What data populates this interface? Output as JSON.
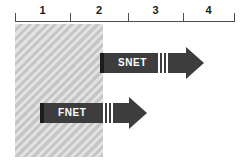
{
  "figure": {
    "background_color": "#ffffff",
    "width": 248,
    "height": 167
  },
  "axis": {
    "name": "phase-timeline",
    "line_color": "#4d4d4d",
    "tick_positions": [
      15,
      70,
      128,
      183,
      234
    ],
    "labels": [
      {
        "text": "1",
        "left": 15,
        "width": 55
      },
      {
        "text": "2",
        "left": 70,
        "width": 58
      },
      {
        "text": "3",
        "left": 128,
        "width": 55
      },
      {
        "text": "4",
        "left": 183,
        "width": 51
      }
    ]
  },
  "region": {
    "name": "hatched-phase-region",
    "fill_color": "#c6c6c6",
    "hatch_color": "#e2e2e2",
    "left": 15,
    "top": 24,
    "width": 88,
    "height": 133
  },
  "arrows": [
    {
      "label": "SNET",
      "color": "#3d3d3d",
      "cap_color": "#1c1c1c",
      "top": 53,
      "shaft_left": 100,
      "shaft_width": 88,
      "head_left": 186,
      "tip_x": 205,
      "label_left": 118,
      "gaps": [
        158,
        162,
        166
      ]
    },
    {
      "label": "FNET",
      "color": "#3d3d3d",
      "cap_color": "#1c1c1c",
      "top": 103,
      "shaft_left": 40,
      "shaft_width": 91,
      "head_left": 129,
      "tip_x": 148,
      "label_left": 58,
      "gaps": [
        103,
        107,
        111
      ]
    }
  ]
}
